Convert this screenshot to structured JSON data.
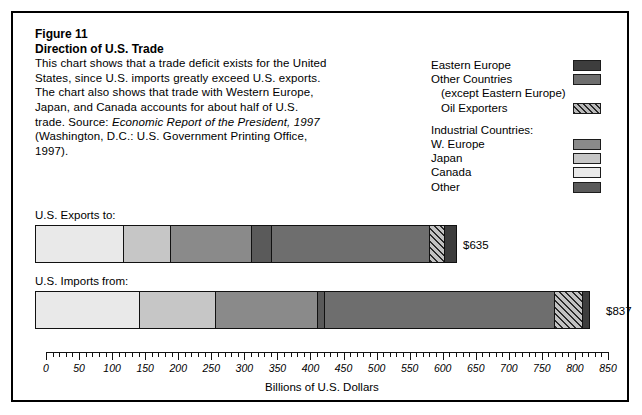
{
  "figure": {
    "number_label": "Figure 11",
    "title": "Direction of U.S. Trade",
    "caption_lines": [
      "This chart shows that a trade deficit exists for the United",
      "States, since U.S. imports greatly exceed U.S. exports.",
      "The chart also shows that trade with Western Europe,",
      "Japan, and Canada accounts for about half of U.S."
    ],
    "source_prefix": "trade. Source: ",
    "source_italic": "Economic Report of the President, 1997",
    "source_rest_line": "(Washington, D.C.: U.S. Government Printing Office,",
    "source_last_line": "1997)."
  },
  "legend": {
    "groups": [
      {
        "items": [
          {
            "label": "Eastern Europe",
            "swatch": "eastern-europe",
            "color": "#3d3d3d",
            "pattern": "solid",
            "indent": false,
            "has_swatch": true
          },
          {
            "label": "Other Countries",
            "swatch": "other-countries",
            "color": "#6e6e6e",
            "pattern": "solid",
            "indent": false,
            "has_swatch": true
          },
          {
            "label": "(except Eastern Europe)",
            "swatch": "",
            "color": "",
            "pattern": "none",
            "indent": true,
            "has_swatch": false
          },
          {
            "label": "Oil Exporters",
            "swatch": "oil-exporters",
            "color": "#8e8e8e",
            "pattern": "hatch",
            "indent": true,
            "has_swatch": true
          }
        ]
      },
      {
        "heading": "Industrial Countries:",
        "items": [
          {
            "label": "W. Europe",
            "swatch": "w-europe",
            "color": "#8a8a8a",
            "pattern": "solid",
            "indent": false,
            "has_swatch": true
          },
          {
            "label": "Japan",
            "swatch": "japan",
            "color": "#c6c6c6",
            "pattern": "solid",
            "indent": false,
            "has_swatch": true
          },
          {
            "label": "Canada",
            "swatch": "canada",
            "color": "#e9e9e9",
            "pattern": "solid",
            "indent": false,
            "has_swatch": true
          },
          {
            "label": "Other",
            "swatch": "other-industrial",
            "color": "#5a5a5a",
            "pattern": "solid",
            "indent": false,
            "has_swatch": true
          }
        ]
      }
    ]
  },
  "bars": {
    "exports": {
      "title": "U.S. Exports to:",
      "value_label": "$635"
    },
    "imports": {
      "title": "U.S. Imports from:",
      "value_label": "$837"
    }
  },
  "axis": {
    "title": "Billions of U.S. Dollars",
    "tick_labels": [
      "0",
      "50",
      "100",
      "150",
      "200",
      "250",
      "300",
      "350",
      "400",
      "450",
      "500",
      "550",
      "600",
      "650",
      "700",
      "750",
      "800",
      "850"
    ]
  },
  "chart_data": {
    "type": "bar",
    "orientation": "horizontal",
    "stacked": true,
    "title": "Direction of U.S. Trade",
    "xlabel": "Billions of U.S. Dollars",
    "ylabel": "",
    "xlim": [
      0,
      850
    ],
    "xticks": [
      0,
      50,
      100,
      150,
      200,
      250,
      300,
      350,
      400,
      450,
      500,
      550,
      600,
      650,
      700,
      750,
      800,
      850
    ],
    "minor_tick_step": 10,
    "grid": false,
    "legend_position": "top-right",
    "categories": [
      "U.S. Exports to:",
      "U.S. Imports from:"
    ],
    "totals": [
      635,
      837
    ],
    "total_labels": [
      "$635",
      "$837"
    ],
    "series": [
      {
        "name": "Canada",
        "group": "Industrial Countries",
        "color": "#e9e9e9",
        "pattern": "solid",
        "values": [
          133,
          157
        ]
      },
      {
        "name": "Japan",
        "group": "Industrial Countries",
        "color": "#c6c6c6",
        "pattern": "solid",
        "values": [
          71,
          115
        ]
      },
      {
        "name": "W. Europe",
        "group": "Industrial Countries",
        "color": "#8a8a8a",
        "pattern": "solid",
        "values": [
          123,
          155
        ]
      },
      {
        "name": "Other",
        "group": "Industrial Countries",
        "color": "#5a5a5a",
        "pattern": "solid",
        "values": [
          30,
          10
        ]
      },
      {
        "name": "Other Countries",
        "group": "Non-Industrial",
        "color": "#6e6e6e",
        "pattern": "solid",
        "values": [
          239,
          348
        ]
      },
      {
        "name": "Oil Exporters",
        "group": "Non-Industrial",
        "color": "#8e8e8e",
        "pattern": "hatch",
        "values": [
          23,
          43
        ]
      },
      {
        "name": "Eastern Europe",
        "group": "Non-Industrial",
        "color": "#3d3d3d",
        "pattern": "solid",
        "values": [
          16,
          9
        ]
      }
    ]
  }
}
